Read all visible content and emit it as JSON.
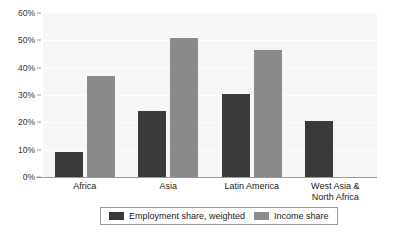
{
  "chart_data": {
    "type": "bar",
    "title": "",
    "subtitle": "",
    "xlabel": "",
    "ylabel": "",
    "grid": true,
    "legend_position": "bottom",
    "ylim": [
      0,
      60
    ],
    "ytick_labels": [
      "0%",
      "10%",
      "20%",
      "30%",
      "40%",
      "50%",
      "60%"
    ],
    "ytick_values": [
      0,
      10,
      20,
      30,
      40,
      50,
      60
    ],
    "categories": [
      "Africa",
      "Asia",
      "Latin America",
      "West Asia &\nNorth Africa"
    ],
    "series": [
      {
        "name": "Employment share, weighted",
        "color": "#3a3a3a",
        "values": [
          9,
          24,
          30.5,
          20.5
        ]
      },
      {
        "name": "Income share",
        "color": "#8a8a8a",
        "values": [
          37,
          51,
          46.5,
          null
        ]
      }
    ]
  },
  "colors": {
    "employment_share": "#3a3a3a",
    "income_share": "#8a8a8a",
    "plot_background": "#f6f6f6",
    "gridline": "#fdfdfd",
    "axis": "#9a9a9a",
    "page_background": "#ffffff"
  }
}
